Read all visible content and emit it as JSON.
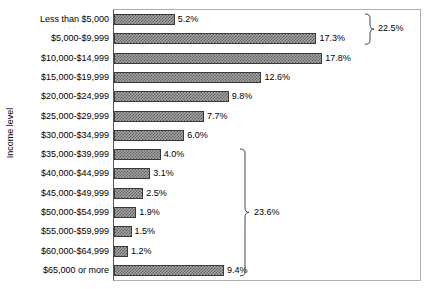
{
  "chart_data": {
    "type": "bar",
    "orientation": "horizontal",
    "title": "",
    "xlabel": "",
    "ylabel": "Income level",
    "grid": false,
    "legend": null,
    "xlim": [
      0,
      20
    ],
    "value_suffix": "%",
    "categories": [
      "Less than $5,000",
      "$5,000-$9,999",
      "$10,000-$14,999",
      "$15,000-$19,999",
      "$20,000-$24,999",
      "$25,000-$29,999",
      "$30,000-$34,999",
      "$35,000-$39,999",
      "$40,000-$44,999",
      "$45,000-$49,999",
      "$50,000-$54,999",
      "$55,000-$59,999",
      "$60,000-$64,999",
      "$65,000 or more"
    ],
    "values": [
      5.2,
      17.3,
      17.8,
      12.6,
      9.8,
      7.7,
      6.0,
      4.0,
      3.1,
      2.5,
      1.9,
      1.5,
      1.2,
      9.4
    ],
    "value_labels": [
      "5.2%",
      "17.3%",
      "17.8%",
      "12.6%",
      "9.8%",
      "7.7%",
      "6.0%",
      "4.0%",
      "3.1%",
      "2.5%",
      "1.9%",
      "1.5%",
      "1.2%",
      "9.4%"
    ],
    "annotations": [
      {
        "name": "upper-brace",
        "label": "22.5%",
        "spans_categories": [
          "Less than $5,000",
          "$5,000-$9,999"
        ],
        "from_index": 0,
        "to_index": 1
      },
      {
        "name": "lower-brace",
        "label": "23.6%",
        "spans_categories": [
          "$35,000-$39,999",
          "$65,000 or more"
        ],
        "from_index": 7,
        "to_index": 13
      }
    ]
  },
  "colors": {
    "bar_fill": "#a8a8a8",
    "bar_pattern": "#5a5a5a",
    "bar_border": "#3a3a3a",
    "axis": "#555555",
    "frame": "#b0b0b0",
    "text": "#000000",
    "background": "#ffffff"
  }
}
